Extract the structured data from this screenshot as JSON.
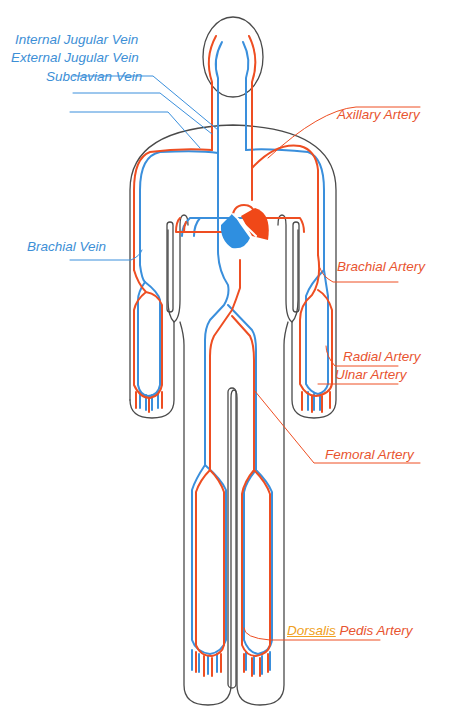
{
  "colors": {
    "vein": "#3a8fdc",
    "artery": "#ee4e22",
    "outline": "#4a4a4a",
    "heart_right": "#2f8fe0",
    "heart_left": "#f04818",
    "dorsalis_highlight": "#f0a020"
  },
  "labels": {
    "veins": [
      {
        "id": "internal-jugular-vein",
        "text": "Internal Jugular Vein"
      },
      {
        "id": "external-jugular-vein",
        "text": "External Jugular Vein"
      },
      {
        "id": "subclavian-vein",
        "text": "Subclavian Vein"
      },
      {
        "id": "brachial-vein",
        "text": "Brachial Vein"
      }
    ],
    "arteries": [
      {
        "id": "axillary-artery",
        "text": "Axillary Artery"
      },
      {
        "id": "brachial-artery",
        "text": "Brachial Artery"
      },
      {
        "id": "radial-artery",
        "text": "Radial Artery"
      },
      {
        "id": "ulnar-artery",
        "text": "Ulnar Artery"
      },
      {
        "id": "femoral-artery",
        "text": "Femoral Artery"
      },
      {
        "id": "dorsalis-pedis-artery",
        "text": "Pedis Artery",
        "prefix": "Dorsalis"
      }
    ]
  }
}
